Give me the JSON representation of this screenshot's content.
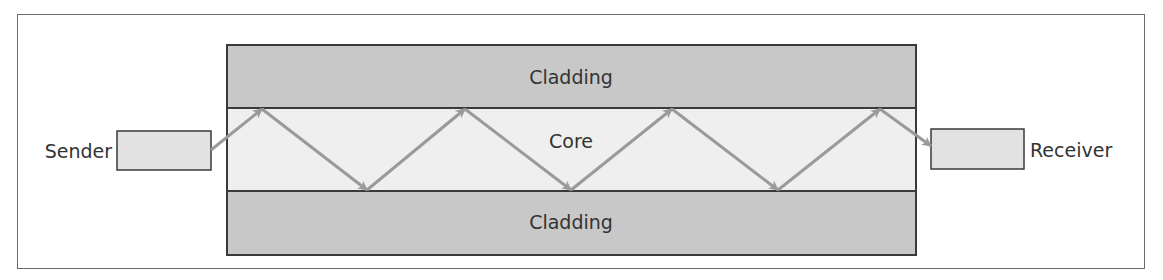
{
  "diagram": {
    "labels": {
      "sender": "Sender",
      "receiver": "Receiver",
      "cladding_top": "Cladding",
      "core": "Core",
      "cladding_bottom": "Cladding"
    },
    "colors": {
      "cladding_fill": "#c8c8c8",
      "core_fill": "#efefef",
      "box_fill": "#e2e2e2",
      "border": "#3a3a3a",
      "ray": "#9a9a9a",
      "text": "#333333"
    },
    "ray_bounces": 7
  }
}
